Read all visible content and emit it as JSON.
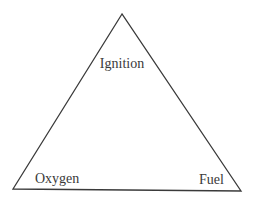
{
  "diagram": {
    "labels": {
      "top": "Ignition",
      "bottom_left": "Oxygen",
      "bottom_right": "Fuel"
    },
    "colors": {
      "stroke": "#3a3a3a",
      "text": "#3a3a3a",
      "background": "#ffffff"
    }
  }
}
